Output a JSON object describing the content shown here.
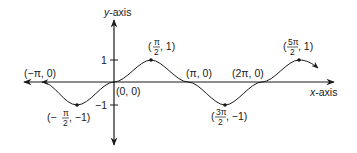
{
  "axes": {
    "x_label_var": "x",
    "x_label_suffix": "-axis",
    "y_label_var": "y",
    "y_label_suffix": "-axis",
    "y_ticks": [
      {
        "value": 1,
        "label": "1"
      },
      {
        "value": -1,
        "label": "−1"
      }
    ]
  },
  "points": {
    "neg_pi": {
      "label": "(−π, 0)"
    },
    "neg_half_pi": {
      "open": "(−",
      "num": "π",
      "den": "2",
      "rest": ", −1)"
    },
    "origin": {
      "label": "(0, 0)"
    },
    "half_pi": {
      "open": "(",
      "num": "π",
      "den": "2",
      "rest": ", 1)"
    },
    "pi": {
      "label": "(π, 0)"
    },
    "three_half_pi": {
      "open": "(",
      "num": "3π",
      "den": "2",
      "rest": ", −1)"
    },
    "two_pi": {
      "label": "(2π, 0)"
    },
    "five_half_pi": {
      "open": "(",
      "num": "5π",
      "den": "2",
      "rest": ", 1)"
    }
  },
  "colors": {
    "ink": "#1a1a1a",
    "background": "#ffffff"
  }
}
